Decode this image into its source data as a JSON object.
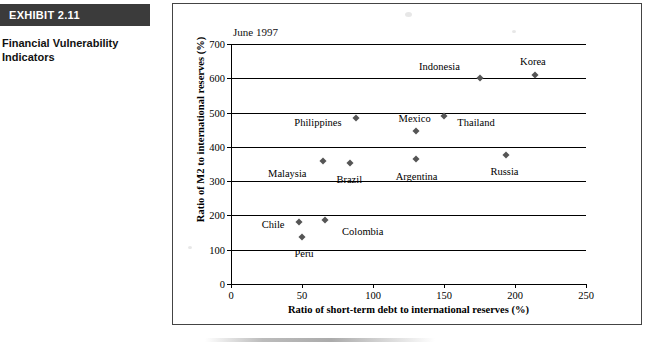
{
  "exhibit": {
    "badge_label": "EXHIBIT 2.11",
    "caption": "Financial Vulnerability Indicators"
  },
  "chart_data": {
    "type": "scatter",
    "title": "",
    "annotation": "June 1997",
    "xlabel": "Ratio of short-term debt to international reserves (%)",
    "ylabel": "Ratio of M2 to international reserves (%)",
    "xlim": [
      0,
      250
    ],
    "ylim": [
      0,
      700
    ],
    "xticks": [
      0,
      50,
      100,
      150,
      200,
      250
    ],
    "yticks": [
      0,
      100,
      200,
      300,
      400,
      500,
      600,
      700
    ],
    "grid": "horizontal",
    "legend": "none",
    "points": [
      {
        "name": "Indonesia",
        "x": 175,
        "y": 600,
        "label_dx": -40,
        "label_dy": -12
      },
      {
        "name": "Korea",
        "x": 214,
        "y": 610,
        "label_dx": -2,
        "label_dy": -14
      },
      {
        "name": "Philippines",
        "x": 88,
        "y": 485,
        "label_dx": -38,
        "label_dy": 4
      },
      {
        "name": "Thailand",
        "x": 150,
        "y": 490,
        "label_dx": 32,
        "label_dy": 6
      },
      {
        "name": "Mexico",
        "x": 130,
        "y": 445,
        "label_dx": -1,
        "label_dy": -13
      },
      {
        "name": "Malaysia",
        "x": 65,
        "y": 360,
        "label_dx": -36,
        "label_dy": 12
      },
      {
        "name": "Brazil",
        "x": 84,
        "y": 352,
        "label_dx": -1,
        "label_dy": 16
      },
      {
        "name": "Argentina",
        "x": 130,
        "y": 365,
        "label_dx": 1,
        "label_dy": 17
      },
      {
        "name": "Russia",
        "x": 194,
        "y": 375,
        "label_dx": -2,
        "label_dy": 16
      },
      {
        "name": "Chile",
        "x": 48,
        "y": 182,
        "label_dx": -26,
        "label_dy": 2
      },
      {
        "name": "Colombia",
        "x": 66,
        "y": 188,
        "label_dx": 38,
        "label_dy": 11
      },
      {
        "name": "Peru",
        "x": 50,
        "y": 137,
        "label_dx": 2,
        "label_dy": 16
      }
    ]
  }
}
